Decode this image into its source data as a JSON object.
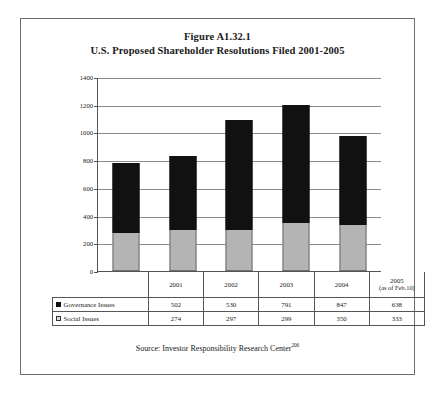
{
  "figure": {
    "title_line1": "Figure A1.32.1",
    "title_line2": "U.S. Proposed Shareholder Resolutions Filed 2001-2005",
    "source_text": "Source: Investor Responsibility Research Center",
    "source_footnote": "206"
  },
  "colors": {
    "governance": "#111111",
    "social": "#b4b4b4",
    "gridline": "#8a8a8a",
    "axis": "#555555",
    "border": "#6e6e6e"
  },
  "table": {
    "year_labels": [
      "2001",
      "2002",
      "2003",
      "2004",
      "2005"
    ],
    "year_2005_note": "(as of Feb.10)",
    "rows": [
      {
        "label": "Governance Issues",
        "marker": "filled-square-icon",
        "values": [
          "502",
          "530",
          "791",
          "847",
          "638"
        ]
      },
      {
        "label": "Social Issues",
        "marker": "outlined-square-icon",
        "values": [
          "274",
          "297",
          "299",
          "350",
          "333"
        ]
      }
    ]
  },
  "chart_data": {
    "type": "bar",
    "stacked": true,
    "title": "U.S. Proposed Shareholder Resolutions Filed 2001-2005",
    "xlabel": "",
    "ylabel": "",
    "categories": [
      "2001",
      "2002",
      "2003",
      "2004",
      "2005"
    ],
    "series": [
      {
        "name": "Social Issues",
        "values": [
          274,
          297,
          299,
          350,
          333
        ],
        "color": "#b4b4b4",
        "stack_position": "bottom"
      },
      {
        "name": "Governance Issues",
        "values": [
          502,
          530,
          791,
          847,
          638
        ],
        "color": "#111111",
        "stack_position": "top"
      }
    ],
    "totals": [
      776,
      827,
      1090,
      1197,
      971
    ],
    "ylim": [
      0,
      1400
    ],
    "ytick_labels": [
      "0",
      "200",
      "400",
      "600",
      "800",
      "1000",
      "1200",
      "1400"
    ],
    "ytick_values": [
      0,
      200,
      400,
      600,
      800,
      1000,
      1200,
      1400
    ],
    "grid": true,
    "legend_position": "table-row-labels"
  }
}
